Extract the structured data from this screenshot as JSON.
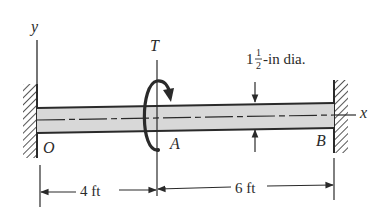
{
  "diagram": {
    "type": "shaft-torsion-figure",
    "labels": {
      "y_axis": "y",
      "x_axis": "x",
      "torque": "T",
      "point_O": "O",
      "point_A": "A",
      "point_B": "B",
      "diameter_whole": "1",
      "diameter_num": "1",
      "diameter_den": "2",
      "diameter_suffix": "-in dia.",
      "dim_left": "4 ft",
      "dim_right": "6 ft"
    },
    "colors": {
      "ink": "#2a2a2a",
      "shaft_fill": "#d8d8d8",
      "background": "#ffffff"
    },
    "supports": [
      "fixed wall at O (left)",
      "fixed wall at B (right)"
    ],
    "dimensions": [
      {
        "from": "O",
        "to": "A",
        "length": "4 ft"
      },
      {
        "from": "A",
        "to": "B",
        "length": "6 ft"
      }
    ]
  }
}
